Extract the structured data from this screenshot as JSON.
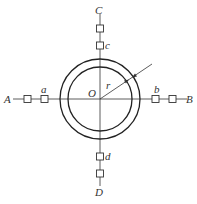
{
  "diagram": {
    "center": {
      "label": "O",
      "x": 100,
      "y": 99
    },
    "radius_label": "r",
    "circles": {
      "outer_r": 40,
      "inner_r": 32
    },
    "axis_labels": {
      "A": "A",
      "B": "B",
      "C": "C",
      "D": "D"
    },
    "point_labels": {
      "a": "a",
      "b": "b",
      "c": "c",
      "d": "d"
    },
    "colors": {
      "stroke": "#333333",
      "background": "#ffffff"
    }
  }
}
